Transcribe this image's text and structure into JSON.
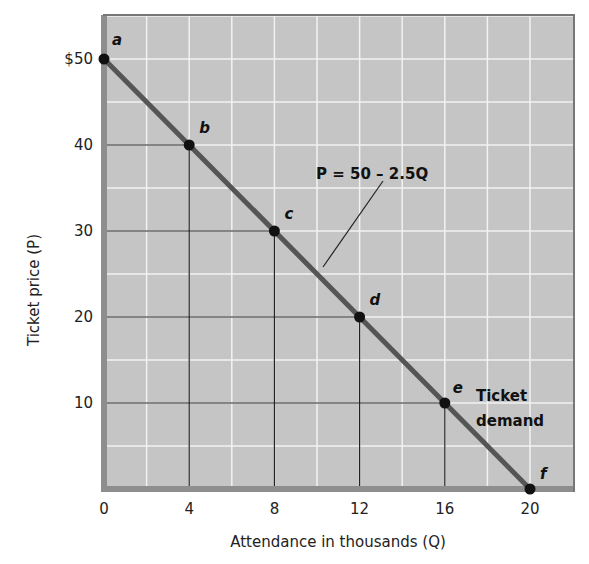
{
  "chart_data": {
    "type": "line",
    "title": "",
    "xlabel": "Attendance in thousands (Q)",
    "ylabel": "Ticket price (P)",
    "xlim": [
      0,
      22
    ],
    "ylim": [
      0,
      55
    ],
    "grid": true,
    "x_ticks": [
      0,
      4,
      8,
      12,
      16,
      20
    ],
    "x_tick_labels": [
      "0",
      "4",
      "8",
      "12",
      "16",
      "20"
    ],
    "y_ticks": [
      10,
      20,
      30,
      40,
      50
    ],
    "y_tick_labels": [
      "10",
      "20",
      "30",
      "40",
      "$50"
    ],
    "series": [
      {
        "name": "Ticket demand",
        "equation": "P = 50 – 2.5Q",
        "points": [
          {
            "label": "a",
            "Q": 0,
            "P": 50
          },
          {
            "label": "b",
            "Q": 4,
            "P": 40
          },
          {
            "label": "c",
            "Q": 8,
            "P": 30
          },
          {
            "label": "d",
            "Q": 12,
            "P": 20
          },
          {
            "label": "e",
            "Q": 16,
            "P": 10
          },
          {
            "label": "f",
            "Q": 20,
            "P": 0
          }
        ]
      }
    ],
    "annotations": [
      "P = 50 – 2.5Q",
      "Ticket demand"
    ]
  },
  "labels": {
    "equation": "P = 50 – 2.5Q",
    "demand_line1": "Ticket",
    "demand_line2": "demand",
    "xlabel": "Attendance in thousands (Q)",
    "ylabel": "Ticket price (P)"
  },
  "colors": {
    "plot_bg": "#c5c5c5",
    "grid": "#f2f2f2",
    "axis_band": "#8e8e8e",
    "demand_line": "#555555",
    "guide_lines": "#222222",
    "points": "#111111"
  }
}
